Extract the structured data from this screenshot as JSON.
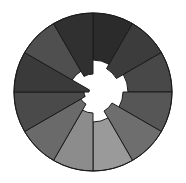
{
  "figure": {
    "title": "",
    "background_color": "#ffffff"
  },
  "chart_data": {
    "type": "pie",
    "variant": "rose-nightingale-polar-area",
    "title": "",
    "subtitle": "",
    "xlabel": "",
    "ylabel": "",
    "legend_position": "none",
    "grid": false,
    "center_x": 93,
    "center_y": 92,
    "outer_radius": 79,
    "sector_count": 12,
    "sector_angle_deg": 30,
    "start_angle_deg": -90,
    "direction": "clockwise",
    "hole_color": "#ffffff",
    "stroke_color": "#1a1a1a",
    "categories": [
      "S1",
      "S2",
      "S3",
      "S4",
      "S5",
      "S6",
      "S7",
      "S8",
      "S9",
      "S10",
      "S11",
      "S12"
    ],
    "series": [
      {
        "name": "inner_radius",
        "values": [
          32,
          27,
          35,
          30,
          22,
          30,
          21,
          14,
          9,
          4,
          24,
          18
        ]
      },
      {
        "name": "outer_radius",
        "values": [
          79,
          79,
          79,
          79,
          79,
          79,
          79,
          79,
          79,
          79,
          79,
          79
        ]
      }
    ],
    "sectors": [
      {
        "label": "S1",
        "start_deg": -90,
        "end_deg": -60,
        "inner_radius": 32,
        "outer_radius": 79,
        "color": "#2b2b2b"
      },
      {
        "label": "S2",
        "start_deg": -60,
        "end_deg": -30,
        "inner_radius": 27,
        "outer_radius": 79,
        "color": "#3c3c3c"
      },
      {
        "label": "S3",
        "start_deg": -30,
        "end_deg": 0,
        "inner_radius": 35,
        "outer_radius": 79,
        "color": "#484848"
      },
      {
        "label": "S4",
        "start_deg": 0,
        "end_deg": 30,
        "inner_radius": 30,
        "outer_radius": 79,
        "color": "#565656"
      },
      {
        "label": "S5",
        "start_deg": 30,
        "end_deg": 60,
        "inner_radius": 22,
        "outer_radius": 79,
        "color": "#6e6e6e"
      },
      {
        "label": "S6",
        "start_deg": 60,
        "end_deg": 90,
        "inner_radius": 30,
        "outer_radius": 79,
        "color": "#9a9a9a"
      },
      {
        "label": "S7",
        "start_deg": 90,
        "end_deg": 120,
        "inner_radius": 21,
        "outer_radius": 79,
        "color": "#8c8c8c"
      },
      {
        "label": "S8",
        "start_deg": 120,
        "end_deg": 150,
        "inner_radius": 14,
        "outer_radius": 79,
        "color": "#6a6a6a"
      },
      {
        "label": "S9",
        "start_deg": 150,
        "end_deg": 180,
        "inner_radius": 9,
        "outer_radius": 79,
        "color": "#4a4a4a"
      },
      {
        "label": "S10",
        "start_deg": 180,
        "end_deg": 210,
        "inner_radius": 4,
        "outer_radius": 79,
        "color": "#3a3a3a"
      },
      {
        "label": "S11",
        "start_deg": 210,
        "end_deg": 240,
        "inner_radius": 24,
        "outer_radius": 79,
        "color": "#4f4f4f"
      },
      {
        "label": "S12",
        "start_deg": 240,
        "end_deg": 270,
        "inner_radius": 18,
        "outer_radius": 79,
        "color": "#303030"
      }
    ]
  }
}
